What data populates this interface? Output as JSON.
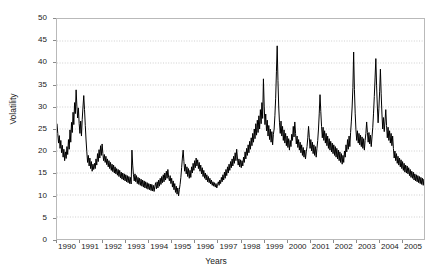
{
  "chart_data": {
    "type": "line",
    "title": "",
    "xlabel": "Years",
    "ylabel": "Volatility",
    "ylim": [
      0,
      50
    ],
    "ytick_step": 5,
    "yticks": [
      0,
      5,
      10,
      15,
      20,
      25,
      30,
      35,
      40,
      45,
      50
    ],
    "xlim": [
      1990,
      2006
    ],
    "xticks": [
      1990,
      1991,
      1992,
      1993,
      1994,
      1995,
      1996,
      1997,
      1998,
      1999,
      2000,
      2001,
      2002,
      2003,
      2004,
      2005
    ],
    "xtick_labels": [
      "1990",
      "1991",
      "1992",
      "1993",
      "1994",
      "1995",
      "1996",
      "1997",
      "1998",
      "1999",
      "2000",
      "2001",
      "2002",
      "2003",
      "2004",
      "2005"
    ],
    "grid": true,
    "grid_style": "dotted",
    "grid_color": "#cfcfcf",
    "legend": false,
    "legend_position": "none",
    "line_color": "#000000",
    "line_width": 1,
    "background_color": "#ffffff",
    "border_color": "#b9b9b9",
    "series": [
      {
        "name": "Volatility",
        "x_start": 1990.0,
        "x_step": 0.0333333,
        "values": [
          26.2,
          24.0,
          21.8,
          23.5,
          20.6,
          22.4,
          19.6,
          21.3,
          18.6,
          20.4,
          17.8,
          19.8,
          18.3,
          21.0,
          19.2,
          22.6,
          20.4,
          24.8,
          22.0,
          26.5,
          24.2,
          28.8,
          26.0,
          31.0,
          28.5,
          33.9,
          30.2,
          27.5,
          29.8,
          26.2,
          24.0,
          26.8,
          23.4,
          27.2,
          30.0,
          32.6,
          29.4,
          25.8,
          22.5,
          19.8,
          17.4,
          19.0,
          16.6,
          18.4,
          16.0,
          17.6,
          15.4,
          17.0,
          15.8,
          17.2,
          16.0,
          18.2,
          16.8,
          19.4,
          17.6,
          20.3,
          18.4,
          21.2,
          19.0,
          21.6,
          19.4,
          17.8,
          19.2,
          17.4,
          18.8,
          16.9,
          18.2,
          16.4,
          17.8,
          16.0,
          17.4,
          15.6,
          17.0,
          15.3,
          16.8,
          15.0,
          16.4,
          14.8,
          16.0,
          14.5,
          15.8,
          14.2,
          15.6,
          13.9,
          15.2,
          13.6,
          15.0,
          13.4,
          14.8,
          13.2,
          14.6,
          13.0,
          14.4,
          12.8,
          14.2,
          12.6,
          14.0,
          12.5,
          20.2,
          16.8,
          14.6,
          13.2,
          14.8,
          13.0,
          14.4,
          12.6,
          14.0,
          12.4,
          13.8,
          12.2,
          13.6,
          12.0,
          13.4,
          11.8,
          13.2,
          11.6,
          13.0,
          11.5,
          12.8,
          11.3,
          12.6,
          11.2,
          12.5,
          11.0,
          12.4,
          10.9,
          12.2,
          10.8,
          12.0,
          12.8,
          11.4,
          13.0,
          11.6,
          13.4,
          12.0,
          13.8,
          12.4,
          14.2,
          12.8,
          14.6,
          13.0,
          15.0,
          13.4,
          15.4,
          13.8,
          15.8,
          14.0,
          13.2,
          14.4,
          12.6,
          13.8,
          11.8,
          13.2,
          11.2,
          12.6,
          10.6,
          12.0,
          10.2,
          11.6,
          9.8,
          11.2,
          12.4,
          14.0,
          16.2,
          18.4,
          20.2,
          17.6,
          15.4,
          17.0,
          14.8,
          16.4,
          14.2,
          16.0,
          13.8,
          15.6,
          14.0,
          16.4,
          15.0,
          17.2,
          15.6,
          17.8,
          16.2,
          18.4,
          16.6,
          18.0,
          16.0,
          17.4,
          15.4,
          16.8,
          14.8,
          16.2,
          14.2,
          15.6,
          13.8,
          15.0,
          13.4,
          14.6,
          13.0,
          14.2,
          12.8,
          13.8,
          12.5,
          13.4,
          12.2,
          13.0,
          12.0,
          12.8,
          11.8,
          12.6,
          11.6,
          12.4,
          13.0,
          12.2,
          13.4,
          12.6,
          14.0,
          13.0,
          14.6,
          13.4,
          15.2,
          13.8,
          15.8,
          14.4,
          16.4,
          15.0,
          17.0,
          15.6,
          17.6,
          16.2,
          18.2,
          16.6,
          18.8,
          17.2,
          19.6,
          17.8,
          20.4,
          18.4,
          16.8,
          18.2,
          16.4,
          18.0,
          16.2,
          17.8,
          16.6,
          18.6,
          17.4,
          19.8,
          18.2,
          20.6,
          19.0,
          21.4,
          19.6,
          22.2,
          20.4,
          23.0,
          21.2,
          24.0,
          22.0,
          25.0,
          22.8,
          26.2,
          23.6,
          27.0,
          24.2,
          28.0,
          25.0,
          29.4,
          26.2,
          31.0,
          27.4,
          36.4,
          30.2,
          26.0,
          28.4,
          24.6,
          27.0,
          23.4,
          25.8,
          22.6,
          25.0,
          22.0,
          24.4,
          21.4,
          23.8,
          25.0,
          28.0,
          32.0,
          38.0,
          43.9,
          36.0,
          30.0,
          26.4,
          24.0,
          26.8,
          23.4,
          25.6,
          22.4,
          24.8,
          21.8,
          24.0,
          21.2,
          23.4,
          20.8,
          22.8,
          20.2,
          22.4,
          21.0,
          23.8,
          22.4,
          25.6,
          23.2,
          26.6,
          24.0,
          21.6,
          23.4,
          20.8,
          22.6,
          20.2,
          22.0,
          19.6,
          21.4,
          19.0,
          20.8,
          18.6,
          20.2,
          18.2,
          19.8,
          21.0,
          23.0,
          25.6,
          23.0,
          20.6,
          22.6,
          20.0,
          22.0,
          19.4,
          21.4,
          19.0,
          21.0,
          18.6,
          20.6,
          22.4,
          25.0,
          28.6,
          32.8,
          29.0,
          25.6,
          23.0,
          25.4,
          22.4,
          24.6,
          21.8,
          24.0,
          21.2,
          23.4,
          20.6,
          22.8,
          20.2,
          22.2,
          19.8,
          21.8,
          19.4,
          21.4,
          19.0,
          21.0,
          18.6,
          20.6,
          18.2,
          20.2,
          17.8,
          19.8,
          17.4,
          19.4,
          17.0,
          19.0,
          17.4,
          20.0,
          18.6,
          21.4,
          19.8,
          22.6,
          20.4,
          23.4,
          21.0,
          24.2,
          26.8,
          30.0,
          34.4,
          42.5,
          34.0,
          28.6,
          24.8,
          22.4,
          24.6,
          21.8,
          24.0,
          21.4,
          23.6,
          21.0,
          23.2,
          20.6,
          22.8,
          20.2,
          22.4,
          24.0,
          26.6,
          24.2,
          22.0,
          24.2,
          21.6,
          23.6,
          21.0,
          23.2,
          25.4,
          28.6,
          32.4,
          36.6,
          41.0,
          34.8,
          30.0,
          26.4,
          29.6,
          33.6,
          38.6,
          33.0,
          28.4,
          25.0,
          27.6,
          24.4,
          26.8,
          29.4,
          25.8,
          23.0,
          25.4,
          22.4,
          24.6,
          21.8,
          24.0,
          21.2,
          23.4,
          20.6,
          18.4,
          20.0,
          17.8,
          19.4,
          17.2,
          18.8,
          16.8,
          18.4,
          16.4,
          18.0,
          16.0,
          17.6,
          15.6,
          17.2,
          15.2,
          16.8,
          15.0,
          16.6,
          14.8,
          16.2,
          14.4,
          15.8,
          14.0,
          15.4,
          13.8,
          15.2,
          13.4,
          14.8,
          13.2,
          14.6,
          13.0,
          14.4,
          12.8,
          14.2,
          12.6,
          14.0,
          12.4,
          13.8,
          12.2,
          13.6,
          12.0,
          13.4,
          11.8,
          13.2,
          11.6,
          13.0,
          11.4,
          12.8,
          11.2,
          12.6,
          11.0,
          12.4,
          11.4,
          13.0,
          11.8,
          13.4,
          12.2,
          13.8,
          12.4,
          14.2,
          12.8,
          14.6,
          13.2,
          15.0,
          13.4,
          12.2,
          13.6,
          11.8,
          13.0,
          11.4,
          12.6,
          11.0,
          12.2,
          10.8,
          12.0,
          11.2,
          13.0,
          12.0,
          14.0,
          12.6,
          14.6,
          13.0,
          11.8,
          13.2,
          11.6,
          12.8,
          11.4,
          12.6,
          11.2,
          12.4,
          11.0,
          12.2,
          11.6,
          13.4,
          12.4,
          14.4,
          13.0,
          11.8,
          13.2
        ]
      }
    ]
  }
}
